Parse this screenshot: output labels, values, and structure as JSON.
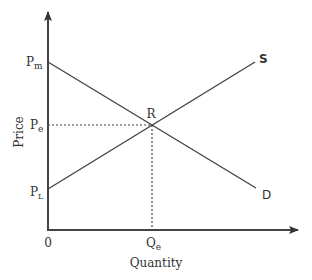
{
  "diagram": {
    "type": "supply-demand",
    "x_axis_label": "Quantity",
    "y_axis_label": "Price",
    "origin_label": "0",
    "price_labels": {
      "max": {
        "main": "P",
        "sub": "m"
      },
      "equilibrium": {
        "main": "P",
        "sub": "e"
      },
      "low": {
        "main": "P",
        "sub": "L"
      }
    },
    "quantity_labels": {
      "equilibrium": {
        "main": "Q",
        "sub": "e"
      }
    },
    "curves": {
      "supply": {
        "label": "S",
        "from": "P_L at Q=0",
        "to": "upper right"
      },
      "demand": {
        "label": "D",
        "from": "P_m at Q=0",
        "to": "lower right"
      }
    },
    "equilibrium_point_label": "R",
    "colors": {
      "line": "#444444",
      "text": "#333333",
      "background": "#ffffff"
    }
  }
}
